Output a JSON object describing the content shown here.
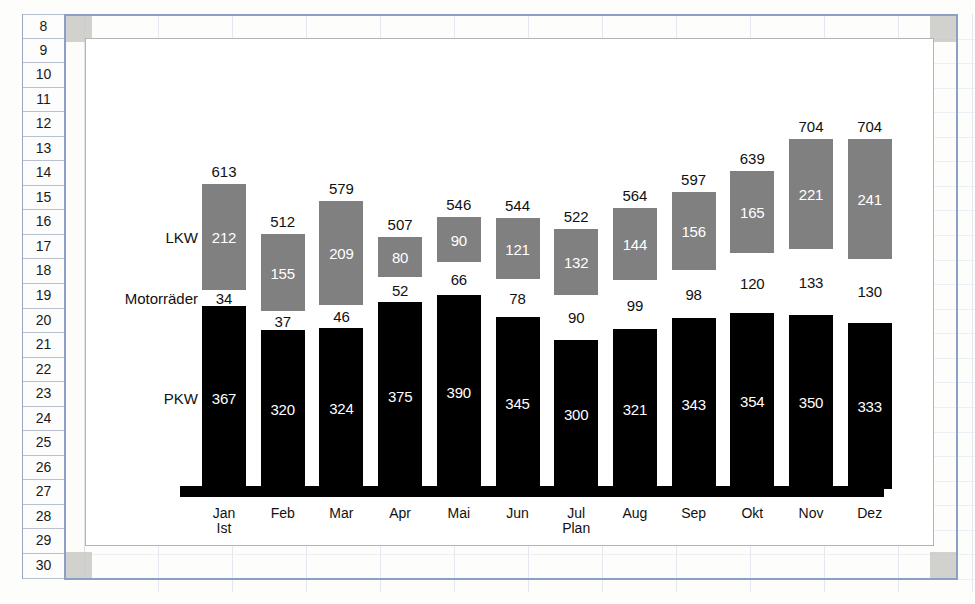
{
  "app": {
    "type": "spreadsheet-with-embedded-chart",
    "row_headers": [
      "8",
      "9",
      "10",
      "11",
      "12",
      "13",
      "14",
      "15",
      "16",
      "17",
      "18",
      "19",
      "20",
      "21",
      "22",
      "23",
      "24",
      "25",
      "26",
      "27",
      "28",
      "29",
      "30"
    ]
  },
  "colors": {
    "pkw": "#000000",
    "motorraeder": "#ffffff",
    "lkw": "#808080",
    "chart_border": "#b4b4b4",
    "selection_frame": "#8ba0c4",
    "handle": "#c9c9c4"
  },
  "series_labels": {
    "lkw": "LKW",
    "motorraeder": "Motorräder",
    "pkw": "PKW"
  },
  "chart_data": {
    "type": "bar",
    "subtype": "stacked",
    "title": "",
    "xlabel": "",
    "ylabel": "",
    "grid": false,
    "legend_position": "inline-left-labels",
    "categories": [
      "Jan",
      "Feb",
      "Mar",
      "Apr",
      "Mai",
      "Jun",
      "Jul",
      "Aug",
      "Sep",
      "Okt",
      "Nov",
      "Dez"
    ],
    "category_sublabels": [
      "Ist",
      "",
      "",
      "",
      "",
      "",
      "Plan",
      "",
      "",
      "",
      "",
      ""
    ],
    "series": [
      {
        "name": "PKW",
        "color": "#000000",
        "values": [
          367,
          320,
          324,
          375,
          390,
          345,
          300,
          321,
          343,
          354,
          350,
          333
        ]
      },
      {
        "name": "Motorräder",
        "color": "#ffffff",
        "values": [
          34,
          37,
          46,
          52,
          66,
          78,
          90,
          99,
          98,
          120,
          133,
          130
        ]
      },
      {
        "name": "LKW",
        "color": "#808080",
        "values": [
          212,
          155,
          209,
          80,
          90,
          121,
          132,
          144,
          156,
          165,
          221,
          241
        ]
      }
    ],
    "totals": [
      613,
      512,
      579,
      507,
      546,
      544,
      522,
      564,
      597,
      639,
      704,
      704
    ],
    "ylim": [
      0,
      780
    ]
  }
}
